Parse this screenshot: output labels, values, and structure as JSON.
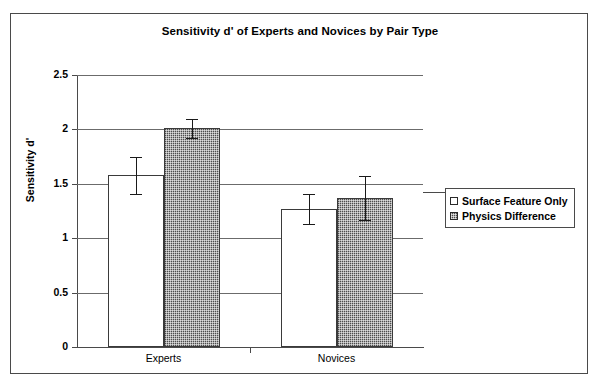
{
  "chart_data": {
    "type": "bar",
    "title": "Sensitivity d' of Experts and Novices by Pair Type",
    "xlabel": "",
    "ylabel": "Sensitivity d'",
    "categories": [
      "Experts",
      "Novices"
    ],
    "ylim": [
      0,
      2.5
    ],
    "yticks": [
      "0",
      "0.5",
      "1",
      "1.5",
      "2",
      "2.5"
    ],
    "ytick_values": [
      0,
      0.5,
      1,
      1.5,
      2,
      2.5
    ],
    "grid": true,
    "legend_position": "right",
    "series": [
      {
        "name": "Surface Feature Only",
        "style": "light",
        "values": [
          1.58,
          1.27
        ],
        "errors": [
          0.17,
          0.14
        ]
      },
      {
        "name": "Physics Difference",
        "style": "dark",
        "values": [
          2.01,
          1.37
        ],
        "errors": [
          0.09,
          0.2
        ]
      }
    ]
  },
  "legend": {
    "items": [
      {
        "label": "Surface Feature Only",
        "swatch": "light-square-icon"
      },
      {
        "label": "Physics Difference",
        "swatch": "dark-square-icon"
      }
    ]
  },
  "axes": {
    "y_label": "Sensitivity d'",
    "y_ticks": [
      "2.5",
      "2",
      "1.5",
      "1",
      "0.5",
      "0"
    ],
    "x_ticks": [
      "Experts",
      "Novices"
    ]
  }
}
